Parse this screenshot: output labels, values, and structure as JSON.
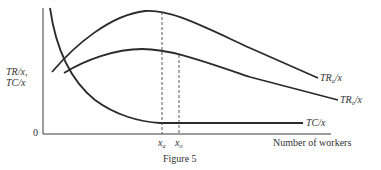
{
  "figure": {
    "caption": "Figure 5",
    "y_axis_label_line1": "TR/x,",
    "y_axis_label_line2": "TC/x",
    "origin_label": "0",
    "x_axis_label": "Number of workers",
    "curves": {
      "tr_a": {
        "label_main": "TR",
        "label_sub": "a",
        "label_tail": "/x"
      },
      "tr_o": {
        "label_main": "TR",
        "label_sub": "o",
        "label_tail": "/x"
      },
      "tc": {
        "label": "TC/x"
      }
    },
    "markers": {
      "x_a": {
        "main": "x",
        "sub": "a"
      },
      "x_o": {
        "main": "x",
        "sub": "o"
      }
    },
    "colors": {
      "line": "#2b2b2b",
      "text": "#333333",
      "background": "#ffffff"
    }
  }
}
